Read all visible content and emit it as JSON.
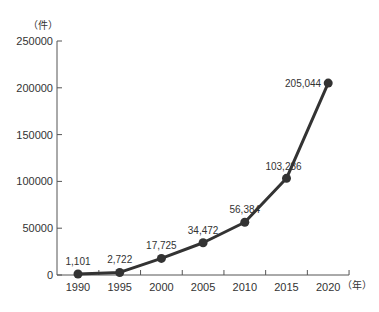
{
  "chart_data": {
    "type": "line",
    "title": "",
    "xlabel": "（年）",
    "ylabel": "（件）",
    "x": [
      1990,
      1995,
      2000,
      2005,
      2010,
      2015,
      2020
    ],
    "categories": [
      "1990",
      "1995",
      "2000",
      "2005",
      "2010",
      "2015",
      "2020"
    ],
    "series": [
      {
        "name": "count",
        "values": [
          1101,
          2722,
          17725,
          34472,
          56384,
          103286,
          205044
        ]
      }
    ],
    "data_labels": [
      "1,101",
      "2,722",
      "17,725",
      "34,472",
      "56,384",
      "103,286",
      "205,044"
    ],
    "yticks": [
      "0",
      "50000",
      "100000",
      "150000",
      "200000",
      "250000"
    ],
    "ylim": [
      0,
      250000
    ],
    "grid": false,
    "legend": "none",
    "line_color": "#333333"
  }
}
